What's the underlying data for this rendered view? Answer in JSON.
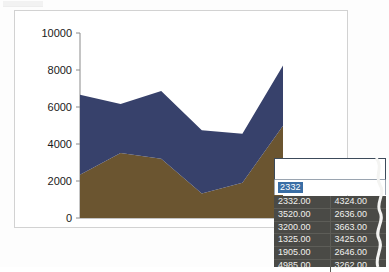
{
  "window": {
    "chart_title": "",
    "background_color": "#ffffff",
    "border_color": "#d2d2d2"
  },
  "chart_data": {
    "type": "area",
    "stacked": true,
    "title": "",
    "xlabel": "",
    "ylabel": "",
    "ylim": [
      0,
      10000
    ],
    "yticks": [
      "0",
      "2000",
      "4000",
      "6000",
      "8000",
      "10000"
    ],
    "ytick_values": [
      0,
      2000,
      4000,
      6000,
      8000,
      10000
    ],
    "grid": false,
    "legend": "none",
    "x": [
      1,
      2,
      3,
      4,
      5,
      6
    ],
    "categories": [
      "1",
      "2",
      "3",
      "4",
      "5",
      "6"
    ],
    "series": [
      {
        "name": "Series 1",
        "color": "#6b5530",
        "values": [
          2332,
          3520,
          3200,
          1325,
          1905,
          4985
        ]
      },
      {
        "name": "Series 2",
        "color": "#37416b",
        "values": [
          4324,
          2636,
          3663,
          3425,
          2646,
          3262
        ]
      }
    ],
    "totals": [
      6656,
      6156,
      6863,
      4750,
      4551,
      8247
    ]
  },
  "data_panel": {
    "edit_field": {
      "value": "2332",
      "selected": true,
      "selection_color": "#3a6ea5"
    },
    "grid": {
      "background_color": "#4a4a46",
      "text_color": "#f1f1ee",
      "columns": [
        "Series 1",
        "Series 2"
      ],
      "rows": [
        [
          "2332.00",
          "4324.00"
        ],
        [
          "3520.00",
          "2636.00"
        ],
        [
          "3200.00",
          "3663.00"
        ],
        [
          "1325.00",
          "3425.00"
        ],
        [
          "1905.00",
          "2646.00"
        ],
        [
          "4985.00",
          "3262.00"
        ]
      ]
    }
  }
}
